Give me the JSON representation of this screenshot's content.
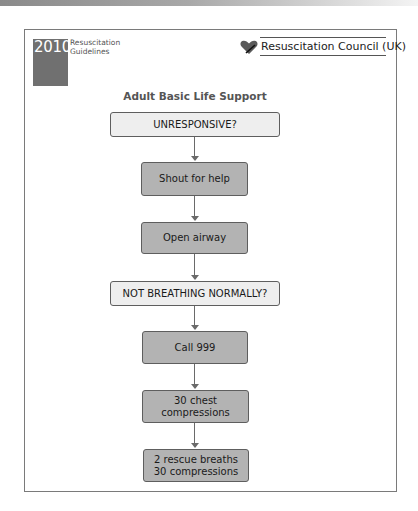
{
  "header": {
    "badge_year": "2010",
    "badge_line1": "Resuscitation",
    "badge_line2": "Guidelines",
    "organization": "Resuscitation Council (UK)",
    "logo_icon": "heart-icon"
  },
  "diagram": {
    "title": "Adult Basic Life Support",
    "steps": [
      {
        "label": "UNRESPONSIVE?",
        "type": "decision"
      },
      {
        "label": "Shout for help",
        "type": "action"
      },
      {
        "label": "Open airway",
        "type": "action"
      },
      {
        "label": "NOT BREATHING NORMALLY?",
        "type": "decision"
      },
      {
        "label": "Call 999",
        "type": "action"
      },
      {
        "label": "30 chest\ncompressions",
        "line1": "30 chest",
        "line2": "compressions",
        "type": "action"
      },
      {
        "label": "2 rescue breaths\n30 compressions",
        "line1": "2 rescue breaths",
        "line2": "30 compressions",
        "type": "action"
      }
    ]
  },
  "colors": {
    "decision_fill": "#eeeeee",
    "action_fill": "#b3b3b3",
    "badge_fill": "#707070",
    "border": "#5e5e5e"
  }
}
